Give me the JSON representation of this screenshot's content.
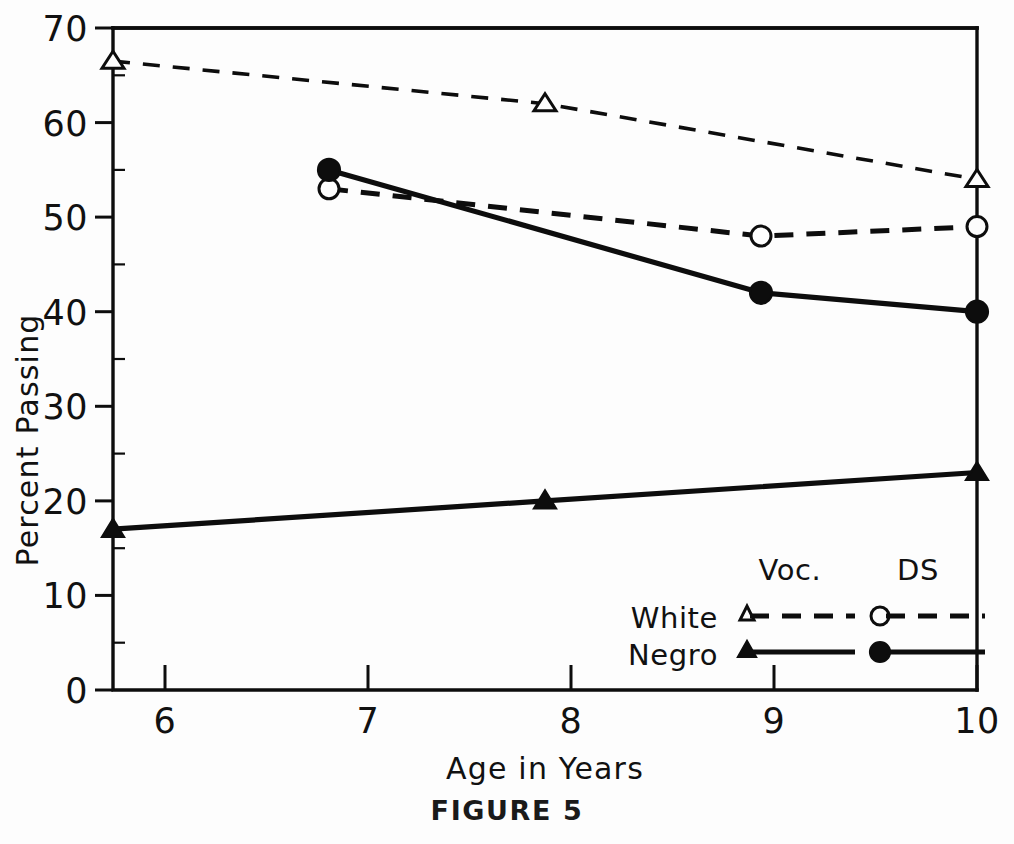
{
  "caption": "FIGURE 5",
  "chart_data": {
    "type": "line",
    "title": "",
    "xlabel": "Age in Years",
    "ylabel": "Percent Passing",
    "x": [
      6,
      7,
      8,
      9,
      10
    ],
    "xlim": [
      6,
      10
    ],
    "ylim": [
      0,
      70
    ],
    "xticks": [
      "6",
      "7",
      "8",
      "9",
      "10"
    ],
    "yticks": [
      "0",
      "10",
      "20",
      "30",
      "40",
      "50",
      "60",
      "70"
    ],
    "grid": false,
    "legend_position": "lower-right",
    "series": [
      {
        "name": "White Voc.",
        "group": "White",
        "test": "Voc.",
        "marker": "open-triangle",
        "line": "dashed",
        "x": [
          6,
          8,
          10
        ],
        "values": [
          66.5,
          62,
          54
        ]
      },
      {
        "name": "White DS",
        "group": "White",
        "test": "DS",
        "marker": "open-circle",
        "line": "dashed",
        "x": [
          7,
          9,
          10
        ],
        "values": [
          53,
          48,
          49
        ]
      },
      {
        "name": "Negro Voc.",
        "group": "Negro",
        "test": "Voc.",
        "marker": "filled-triangle",
        "line": "solid",
        "x": [
          6,
          8,
          10
        ],
        "values": [
          17,
          20,
          23
        ]
      },
      {
        "name": "Negro DS",
        "group": "Negro",
        "test": "DS",
        "marker": "filled-circle",
        "line": "solid",
        "x": [
          7,
          9,
          10
        ],
        "values": [
          55,
          42,
          40
        ]
      }
    ]
  },
  "legend": {
    "column_headers": [
      "Voc.",
      "DS"
    ],
    "rows": [
      {
        "label": "White",
        "voc_marker": "open-triangle",
        "ds_marker": "open-circle",
        "line": "dashed"
      },
      {
        "label": "Negro",
        "voc_marker": "filled-triangle",
        "ds_marker": "filled-circle",
        "line": "solid"
      }
    ]
  },
  "colors": {
    "ink": "#0d0d0d",
    "background": "#fdfdfd"
  }
}
